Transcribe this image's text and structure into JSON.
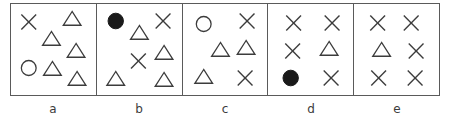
{
  "figure": {
    "title": "",
    "border_color": "#5a5a5a",
    "shape_stroke_color": "#3c3c3c",
    "shape_fill_color": "#1a1a1a",
    "background_color": "#ffffff"
  },
  "panels": [
    {
      "id": "panel-a",
      "label": "a",
      "counts": {
        "triangle": 5,
        "cross": 1,
        "circle_open": 1,
        "circle_filled": 0
      },
      "shapes": [
        {
          "type": "cross",
          "x": 18,
          "y": 18
        },
        {
          "type": "triangle",
          "x": 62,
          "y": 16
        },
        {
          "type": "triangle",
          "x": 41,
          "y": 36
        },
        {
          "type": "triangle",
          "x": 66,
          "y": 48
        },
        {
          "type": "circle-open",
          "x": 18,
          "y": 64
        },
        {
          "type": "triangle",
          "x": 42,
          "y": 66
        },
        {
          "type": "triangle",
          "x": 67,
          "y": 76
        }
      ]
    },
    {
      "id": "panel-b",
      "label": "b",
      "counts": {
        "triangle": 4,
        "cross": 2,
        "circle_open": 0,
        "circle_filled": 1
      },
      "shapes": [
        {
          "type": "circle-filled",
          "x": 19,
          "y": 17
        },
        {
          "type": "triangle",
          "x": 43,
          "y": 30
        },
        {
          "type": "cross",
          "x": 67,
          "y": 17
        },
        {
          "type": "cross",
          "x": 42,
          "y": 57
        },
        {
          "type": "triangle",
          "x": 68,
          "y": 50
        },
        {
          "type": "triangle",
          "x": 19,
          "y": 76
        },
        {
          "type": "triangle",
          "x": 68,
          "y": 77
        }
      ]
    },
    {
      "id": "panel-c",
      "label": "c",
      "counts": {
        "triangle": 3,
        "cross": 2,
        "circle_open": 1,
        "circle_filled": 0
      },
      "shapes": [
        {
          "type": "circle-open",
          "x": 21,
          "y": 20
        },
        {
          "type": "cross",
          "x": 65,
          "y": 17
        },
        {
          "type": "triangle",
          "x": 38,
          "y": 47
        },
        {
          "type": "triangle",
          "x": 64,
          "y": 45
        },
        {
          "type": "triangle",
          "x": 21,
          "y": 74
        },
        {
          "type": "cross",
          "x": 63,
          "y": 74
        }
      ]
    },
    {
      "id": "panel-d",
      "label": "d",
      "counts": {
        "triangle": 1,
        "cross": 4,
        "circle_open": 0,
        "circle_filled": 1
      },
      "shapes": [
        {
          "type": "cross",
          "x": 26,
          "y": 19
        },
        {
          "type": "cross",
          "x": 65,
          "y": 19
        },
        {
          "type": "cross",
          "x": 25,
          "y": 47
        },
        {
          "type": "triangle",
          "x": 62,
          "y": 46
        },
        {
          "type": "circle-filled",
          "x": 23,
          "y": 74
        },
        {
          "type": "cross",
          "x": 64,
          "y": 74
        }
      ]
    },
    {
      "id": "panel-e",
      "label": "e",
      "counts": {
        "triangle": 1,
        "cross": 5,
        "circle_open": 0,
        "circle_filled": 0
      },
      "shapes": [
        {
          "type": "cross",
          "x": 24,
          "y": 19
        },
        {
          "type": "cross",
          "x": 58,
          "y": 19
        },
        {
          "type": "triangle",
          "x": 28,
          "y": 47
        },
        {
          "type": "cross",
          "x": 63,
          "y": 47
        },
        {
          "type": "cross",
          "x": 25,
          "y": 74
        },
        {
          "type": "cross",
          "x": 62,
          "y": 74
        }
      ]
    }
  ]
}
